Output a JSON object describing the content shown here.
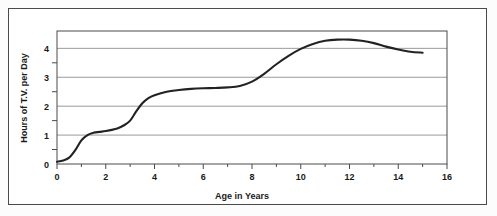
{
  "chart_data": {
    "type": "line",
    "title": "",
    "xlabel": "Age in Years",
    "ylabel": "Hours of T.V. per Day",
    "xlim": [
      0,
      16
    ],
    "ylim": [
      0,
      4.6
    ],
    "xticks": [
      0,
      2,
      4,
      6,
      8,
      10,
      12,
      14,
      16
    ],
    "xtick_labels": [
      "0",
      "2",
      "4",
      "6",
      "8",
      "10",
      "12",
      "14",
      "16"
    ],
    "xminorticks": [
      1,
      3,
      5,
      7,
      9,
      11,
      13,
      15
    ],
    "yticks": [
      0,
      1,
      2,
      3,
      4
    ],
    "ytick_labels": [
      "0",
      "1",
      "2",
      "3",
      "4"
    ],
    "yminorticks": [
      0.5,
      1.5,
      2.5,
      3.5
    ],
    "grid": "horizontal",
    "legend": "none",
    "line_color": "#222222",
    "grid_color": "#9a9a9a",
    "axis_color": "#4a4a4a",
    "series": [
      {
        "name": "Hours of T.V. per Day",
        "x": [
          0.0,
          0.25,
          0.5,
          0.75,
          1.0,
          1.25,
          1.5,
          1.75,
          2.0,
          2.25,
          2.5,
          2.75,
          3.0,
          3.25,
          3.5,
          3.75,
          4.0,
          4.5,
          5.0,
          5.5,
          6.0,
          6.5,
          7.0,
          7.5,
          8.0,
          8.5,
          9.0,
          9.5,
          10.0,
          10.5,
          11.0,
          11.5,
          12.0,
          12.5,
          13.0,
          13.5,
          14.0,
          14.5,
          15.0
        ],
        "y": [
          0.08,
          0.12,
          0.22,
          0.48,
          0.82,
          1.0,
          1.08,
          1.11,
          1.14,
          1.18,
          1.24,
          1.34,
          1.5,
          1.82,
          2.1,
          2.28,
          2.38,
          2.5,
          2.56,
          2.6,
          2.62,
          2.63,
          2.65,
          2.7,
          2.85,
          3.12,
          3.45,
          3.74,
          3.98,
          4.15,
          4.26,
          4.3,
          4.3,
          4.26,
          4.18,
          4.06,
          3.96,
          3.88,
          3.85
        ]
      }
    ]
  },
  "axes": {
    "y_title": "Hours of T.V. per Day",
    "x_title": "Age in Years"
  }
}
